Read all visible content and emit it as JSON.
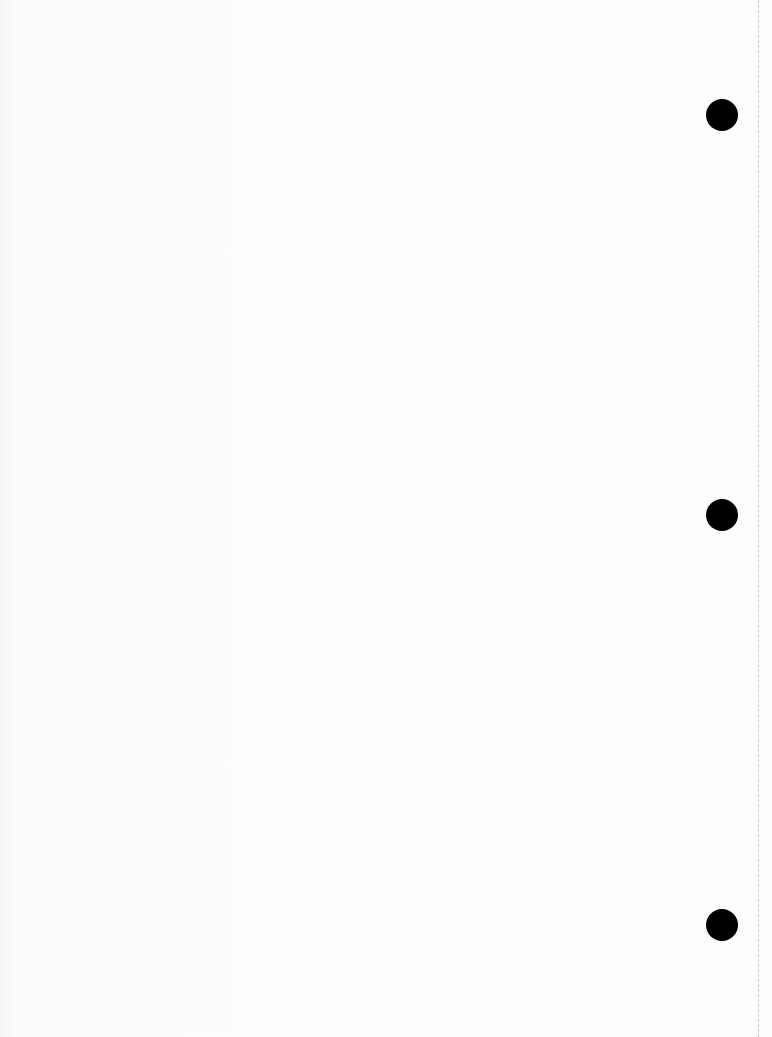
{
  "page": {
    "type": "blank scanned sheet",
    "hole_punches": [
      {
        "x": 722,
        "y": 115
      },
      {
        "x": 722,
        "y": 515
      },
      {
        "x": 722,
        "y": 925
      }
    ],
    "colors": {
      "paper": "#fdfdfd",
      "hole": "#000000",
      "perforation": "#c8c8c8"
    }
  }
}
